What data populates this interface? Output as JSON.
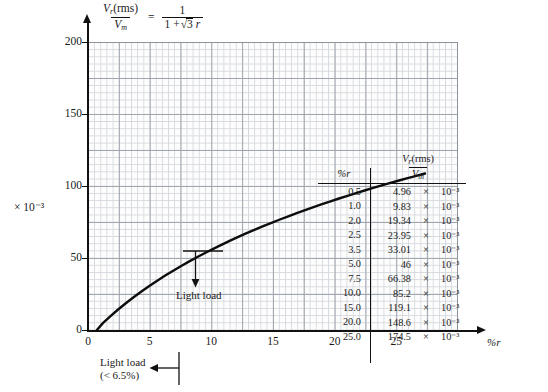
{
  "formula": {
    "lhs_num_v": "V",
    "lhs_num_sub": "r",
    "lhs_num_rest": "(rms)",
    "lhs_den_v": "V",
    "lhs_den_sub": "m",
    "equals": "=",
    "rhs_num": "1",
    "rhs_den_pre": "1 +",
    "rhs_radicand": "3",
    "rhs_den_post": "r"
  },
  "axes": {
    "y_multiplier": "× 10⁻³",
    "y_ticks": [
      "200",
      "150",
      "100",
      "50",
      "0"
    ],
    "x_ticks": [
      "0",
      "5",
      "10",
      "15",
      "20",
      "25"
    ],
    "x_name": "%r"
  },
  "annotations": {
    "in_plot": "Light load",
    "bottom_line1": "Light load",
    "bottom_line2": "(< 6.5%)"
  },
  "table": {
    "header_col1": "%r",
    "header_col2_num_v": "V",
    "header_col2_num_sub": "r",
    "header_col2_num_rest": "(rms)",
    "header_col2_den_v": "V",
    "header_col2_den_sub": "m",
    "rows": [
      {
        "r": "0.5",
        "value": "4.96",
        "times": "×",
        "exp": "10⁻³"
      },
      {
        "r": "1.0",
        "value": "9.83",
        "times": "×",
        "exp": "10⁻³"
      },
      {
        "r": "2.0",
        "value": "19.34",
        "times": "×",
        "exp": "10⁻³"
      },
      {
        "r": "2.5",
        "value": "23.95",
        "times": "×",
        "exp": "10⁻³"
      },
      {
        "r": "3.5",
        "value": "33.01",
        "times": "×",
        "exp": "10⁻³"
      },
      {
        "r": "5.0",
        "value": "46",
        "times": "×",
        "exp": "10⁻³"
      },
      {
        "r": "7.5",
        "value": "66.38",
        "times": "×",
        "exp": "10⁻³"
      },
      {
        "r": "10.0",
        "value": "85.2",
        "times": "×",
        "exp": "10⁻³"
      },
      {
        "r": "15.0",
        "value": "119.1",
        "times": "×",
        "exp": "10⁻³"
      },
      {
        "r": "20.0",
        "value": "148.6",
        "times": "×",
        "exp": "10⁻³"
      },
      {
        "r": "25.0",
        "value": "174.5",
        "times": "×",
        "exp": "10⁻³"
      }
    ]
  },
  "chart_data": {
    "type": "line",
    "title": "",
    "xlabel": "%r",
    "ylabel": "Vr(rms)/Vm",
    "y_multiplier": 0.001,
    "xlim": [
      0,
      25.5
    ],
    "ylim": [
      0,
      200
    ],
    "grid": true,
    "legend": "none",
    "x": [
      0.5,
      1.0,
      2.0,
      2.5,
      3.5,
      5.0,
      7.5,
      10.0,
      15.0,
      20.0,
      25.0
    ],
    "values": [
      4.96,
      9.83,
      19.34,
      23.95,
      33.01,
      46.0,
      66.38,
      85.2,
      119.1,
      148.6,
      174.5
    ],
    "annotations": [
      {
        "text": "Light load",
        "x": 7.5,
        "y": 66.38
      },
      {
        "text": "Light load (< 6.5%)",
        "x": 6.5,
        "y": 0
      }
    ]
  }
}
